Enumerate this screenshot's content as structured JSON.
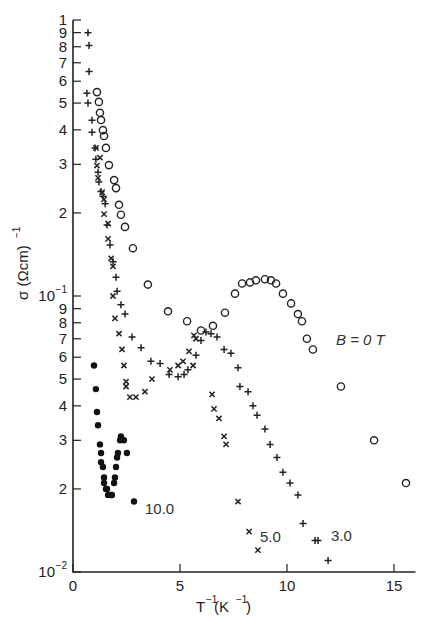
{
  "chart_data": {
    "type": "scatter",
    "title": "",
    "xlabel": "T^-1(K^-1)",
    "ylabel": "σ (Ωcm)^-1",
    "xlim": [
      0,
      16
    ],
    "ylim": [
      0.01,
      1
    ],
    "yscale": "log",
    "grid": false,
    "legend_position": "inline annotations",
    "x_ticks": [
      0,
      5,
      10,
      15
    ],
    "x_tick_labels": [
      "0",
      "5",
      "10",
      "15"
    ],
    "y_ticks": [
      1,
      0.9,
      0.8,
      0.7,
      0.6,
      0.5,
      0.4,
      0.3,
      0.2,
      0.1,
      0.09,
      0.08,
      0.07,
      0.06,
      0.05,
      0.04,
      0.03,
      0.02,
      0.01
    ],
    "y_tick_labels": [
      "1",
      "9",
      "8",
      "7",
      "6",
      "5",
      "4",
      "3",
      "2",
      "10^-1",
      "9",
      "8",
      "7",
      "6",
      "5",
      "4",
      "3",
      "2",
      "10^-2"
    ],
    "series": [
      {
        "name": "B = 0 T",
        "marker": "open-circle",
        "label": "B = 0 T",
        "x": [
          1.12,
          1.21,
          1.26,
          1.31,
          1.4,
          1.45,
          1.54,
          1.68,
          1.92,
          2.01,
          2.15,
          2.24,
          2.43,
          2.8,
          3.5,
          4.44,
          5.33,
          5.98,
          6.54,
          7.1,
          7.57,
          7.9,
          8.27,
          8.55,
          8.97,
          9.25,
          9.49,
          9.81,
          10.19,
          10.51,
          10.7,
          10.93,
          11.21,
          12.52,
          14.07,
          15.56
        ],
        "y": [
          0.548,
          0.505,
          0.461,
          0.434,
          0.399,
          0.38,
          0.344,
          0.298,
          0.263,
          0.246,
          0.214,
          0.197,
          0.178,
          0.149,
          0.11,
          0.088,
          0.081,
          0.075,
          0.078,
          0.087,
          0.102,
          0.111,
          0.112,
          0.114,
          0.115,
          0.114,
          0.111,
          0.102,
          0.094,
          0.086,
          0.081,
          0.07,
          0.064,
          0.047,
          0.03,
          0.021
        ]
      },
      {
        "name": "B = 3.0 T",
        "marker": "plus",
        "label": "3.0",
        "x": [
          0.7,
          0.75,
          0.75,
          0.65,
          0.7,
          0.89,
          0.89,
          1.03,
          1.07,
          1.17,
          1.21,
          1.31,
          1.4,
          1.5,
          1.59,
          1.73,
          1.87,
          2.01,
          2.06,
          2.24,
          2.43,
          2.76,
          3.18,
          3.64,
          4.07,
          4.49,
          4.91,
          5.19,
          5.37,
          5.75,
          5.98,
          6.21,
          6.45,
          6.73,
          7.06,
          7.38,
          7.71,
          7.8,
          8.18,
          8.41,
          8.6,
          8.97,
          9.21,
          9.53,
          9.81,
          10.14,
          10.51,
          10.75,
          11.31,
          11.45,
          11.92
        ],
        "y": [
          0.899,
          0.808,
          0.651,
          0.543,
          0.5,
          0.433,
          0.392,
          0.344,
          0.313,
          0.281,
          0.259,
          0.239,
          0.23,
          0.216,
          0.181,
          0.153,
          0.133,
          0.117,
          0.104,
          0.093,
          0.086,
          0.071,
          0.065,
          0.058,
          0.057,
          0.052,
          0.051,
          0.052,
          0.054,
          0.061,
          0.069,
          0.074,
          0.073,
          0.071,
          0.064,
          0.062,
          0.055,
          0.047,
          0.045,
          0.04,
          0.037,
          0.033,
          0.029,
          0.026,
          0.023,
          0.021,
          0.019,
          0.015,
          0.013,
          0.013,
          0.011
        ]
      },
      {
        "name": "B = 5.0 T",
        "marker": "cross",
        "label": "5.0",
        "x": [
          1.07,
          1.26,
          1.12,
          1.17,
          1.36,
          1.45,
          1.45,
          1.64,
          1.64,
          1.78,
          1.87,
          1.87,
          1.96,
          2.15,
          2.29,
          2.38,
          2.48,
          2.48,
          2.66,
          2.94,
          3.36,
          3.69,
          4.53,
          4.91,
          5.14,
          5.42,
          5.65,
          5.75,
          5.61,
          6.5,
          6.59,
          6.82,
          7.06,
          7.15,
          7.71,
          8.23,
          8.64
        ],
        "y": [
          0.344,
          0.317,
          0.297,
          0.268,
          0.238,
          0.224,
          0.198,
          0.183,
          0.161,
          0.137,
          0.128,
          0.1,
          0.083,
          0.073,
          0.064,
          0.056,
          0.049,
          0.047,
          0.043,
          0.043,
          0.045,
          0.05,
          0.054,
          0.056,
          0.058,
          0.063,
          0.072,
          0.07,
          0.056,
          0.044,
          0.039,
          0.036,
          0.031,
          0.029,
          0.018,
          0.014,
          0.012
        ]
      },
      {
        "name": "B = 10.0 T",
        "marker": "filled-circle",
        "label": "10.0",
        "x": [
          0.98,
          1.07,
          1.12,
          1.17,
          1.26,
          1.31,
          1.31,
          1.4,
          1.45,
          1.45,
          1.54,
          1.59,
          1.64,
          1.78,
          1.82,
          1.92,
          1.96,
          2.01,
          2.06,
          2.1,
          2.2,
          2.24,
          2.38,
          2.52,
          2.85
        ],
        "y": [
          0.056,
          0.046,
          0.038,
          0.034,
          0.029,
          0.027,
          0.025,
          0.024,
          0.022,
          0.021,
          0.02,
          0.02,
          0.019,
          0.019,
          0.019,
          0.021,
          0.022,
          0.024,
          0.026,
          0.027,
          0.03,
          0.031,
          0.03,
          0.027,
          0.018
        ]
      }
    ],
    "annotations": [
      {
        "text": "B = 0 T",
        "near_series": "B = 0 T"
      },
      {
        "text": "3.0",
        "near_series": "B = 3.0 T"
      },
      {
        "text": "5.0",
        "near_series": "B = 5.0 T"
      },
      {
        "text": "10.0",
        "near_series": "B = 10.0 T"
      }
    ]
  },
  "labels": {
    "ylabel": "σ (Ωcm)",
    "ylabel_sup": "−1",
    "xlabel_base": "T",
    "xlabel_sup1": "−1",
    "xlabel_mid": "(K",
    "xlabel_sup2": "−1",
    "xlabel_end": ")",
    "b0": "B = 0 T",
    "b3": "3.0",
    "b5": "5.0",
    "b10": "10.0"
  }
}
